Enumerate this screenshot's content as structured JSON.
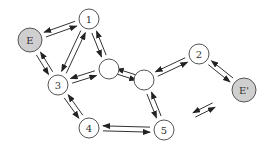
{
  "diagram": {
    "type": "reaction-network",
    "nodes": [
      {
        "id": "E",
        "label": "E",
        "x": 30,
        "y": 40,
        "r": 12,
        "shaded": true
      },
      {
        "id": "1",
        "label": "1",
        "x": 89,
        "y": 19,
        "r": 10,
        "shaded": false
      },
      {
        "id": "a",
        "label": "",
        "x": 109,
        "y": 69,
        "r": 10,
        "shaded": false
      },
      {
        "id": "3",
        "label": "3",
        "x": 58,
        "y": 85,
        "r": 10,
        "shaded": false
      },
      {
        "id": "4",
        "label": "4",
        "x": 89,
        "y": 128,
        "r": 10,
        "shaded": false
      },
      {
        "id": "b",
        "label": "",
        "x": 144,
        "y": 80,
        "r": 10,
        "shaded": false
      },
      {
        "id": "2",
        "label": "2",
        "x": 199,
        "y": 54,
        "r": 10,
        "shaded": false
      },
      {
        "id": "Ep",
        "label": "E'",
        "x": 244,
        "y": 90,
        "r": 12,
        "shaded": true
      },
      {
        "id": "5",
        "label": "5",
        "x": 164,
        "y": 130,
        "r": 10,
        "shaded": false
      }
    ],
    "edges": [
      {
        "from": "E",
        "to": "1",
        "type": "reversible"
      },
      {
        "from": "1",
        "to": "a",
        "type": "reversible"
      },
      {
        "from": "3",
        "to": "1",
        "type": "reversible"
      },
      {
        "from": "E",
        "to": "3",
        "type": "reversible"
      },
      {
        "from": "3",
        "to": "a",
        "type": "reversible"
      },
      {
        "from": "3",
        "to": "4",
        "type": "reversible"
      },
      {
        "from": "4",
        "to": "5",
        "type": "reversible"
      },
      {
        "from": "b",
        "to": "2",
        "type": "reversible"
      },
      {
        "from": "b",
        "to": "5",
        "type": "reversible"
      },
      {
        "from": "2",
        "to": "Ep",
        "type": "reversible"
      },
      {
        "from": "a",
        "to": "b",
        "type": "reversible-detached"
      },
      {
        "from": "5",
        "to": "Ep",
        "type": "reversible-detached"
      }
    ]
  }
}
